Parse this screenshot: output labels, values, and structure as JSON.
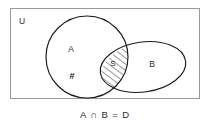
{
  "figure": {
    "type": "venn-diagram",
    "universe_label": "U",
    "caption": "A ∩ B = D",
    "sets": [
      {
        "id": "A",
        "label": "A",
        "shape": "circle"
      },
      {
        "id": "B",
        "label": "B",
        "shape": "ellipse"
      }
    ],
    "regions": [
      {
        "id": "A-only",
        "label": "A",
        "shaded": false
      },
      {
        "id": "A-only-marker",
        "label": "#",
        "shaded": false
      },
      {
        "id": "A-intersect-B",
        "label": "S",
        "shaded": true,
        "fill_pattern": "diagonal-hatch"
      },
      {
        "id": "B-only",
        "label": "B",
        "shaded": false
      }
    ],
    "colors": {
      "outline": "#1a1a1a",
      "frame": "#9a9a9a",
      "text": "#2b2b2b",
      "background": "#ffffff",
      "hatch": "#1a1a1a"
    }
  }
}
